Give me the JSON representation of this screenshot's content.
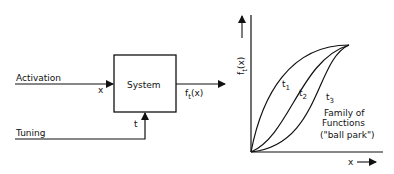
{
  "left": {
    "system_label": "System",
    "activation_label": "Activation",
    "input_var": "x",
    "tuning_label": "Tuning",
    "tuning_var": "t",
    "output_label": "f",
    "output_sub": "t",
    "output_arg": "(x)"
  },
  "right": {
    "y_axis_label": "f",
    "y_axis_sub": "t",
    "y_axis_arg": "(x)",
    "x_axis_label": "x",
    "curves": [
      {
        "label": "t",
        "sub": "1"
      },
      {
        "label": "t",
        "sub": "2"
      },
      {
        "label": "t",
        "sub": "3"
      }
    ],
    "caption_line1": "Family of",
    "caption_line2": "Functions",
    "caption_line3": "(\"ball park\")"
  }
}
